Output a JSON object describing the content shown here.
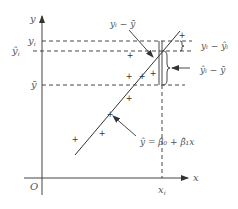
{
  "diagram": {
    "type": "regression-deviation-decomposition",
    "axes": {
      "x_label": "x",
      "y_label": "y",
      "origin_label": "O"
    },
    "y_ticks": {
      "yi": "y",
      "yi_sub": "i",
      "yhat_i": "ŷ",
      "yhat_i_sub": "i",
      "ybar": "ȳ"
    },
    "x_ticks": {
      "xi": "x",
      "xi_sub": "i"
    },
    "annotations": {
      "total_dev": "yᵢ − ȳ",
      "residual": "yᵢ − ŷᵢ",
      "explained": "ŷᵢ − ȳ",
      "regression_eq": "ŷ = β̂₀ + β̂₁x"
    },
    "data_points": [
      {
        "x": 77,
        "y": 139
      },
      {
        "x": 102,
        "y": 133
      },
      {
        "x": 109,
        "y": 114
      },
      {
        "x": 128,
        "y": 98
      },
      {
        "x": 130,
        "y": 76
      },
      {
        "x": 142,
        "y": 73
      },
      {
        "x": 152,
        "y": 75
      },
      {
        "x": 180,
        "y": 35
      },
      {
        "x": 128,
        "y": 54
      }
    ],
    "colors": {
      "line": "#333333",
      "text": "#555555"
    }
  }
}
